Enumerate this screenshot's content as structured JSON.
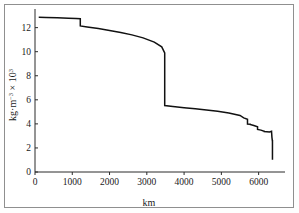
{
  "chart_data": {
    "type": "line",
    "title": "",
    "subtitle": "",
    "xlabel": "km",
    "ylabel": "kg·m⁻³ × 10³",
    "ylabel_parts": {
      "base": "kg·m",
      "exp1": "−3",
      "mid": " × 10",
      "exp2": "3"
    },
    "xlim": [
      0,
      6600
    ],
    "ylim": [
      0,
      13.3
    ],
    "xticks": [
      0,
      1000,
      2000,
      3000,
      4000,
      5000,
      6000
    ],
    "xticklabels": [
      "0",
      "1000",
      "2000",
      "3000",
      "4000",
      "5000",
      "6000"
    ],
    "yticks": [
      0,
      2,
      4,
      6,
      8,
      10,
      12
    ],
    "yticklabels": [
      "0",
      "2",
      "4",
      "6",
      "8",
      "10",
      "12"
    ],
    "grid": false,
    "legend": null,
    "series": [
      {
        "name": "density",
        "x": [
          100,
          300,
          600,
          900,
          1100,
          1215,
          1215,
          1400,
          1700,
          2000,
          2300,
          2600,
          2900,
          3200,
          3400,
          3480,
          3480,
          3700,
          4000,
          4300,
          4600,
          4900,
          5200,
          5500,
          5600,
          5701,
          5701,
          5771,
          5771,
          5871,
          5971,
          5971,
          6061,
          6151,
          6151,
          6221,
          6291,
          6346,
          6346,
          6356,
          6368,
          6371,
          6371
        ],
        "y": [
          12.86,
          12.85,
          12.83,
          12.79,
          12.76,
          12.74,
          12.14,
          12.06,
          11.92,
          11.76,
          11.6,
          11.4,
          11.15,
          10.8,
          10.4,
          9.9,
          5.52,
          5.45,
          5.35,
          5.25,
          5.15,
          5.05,
          4.9,
          4.7,
          4.5,
          4.38,
          3.99,
          3.97,
          3.96,
          3.87,
          3.76,
          3.54,
          3.48,
          3.38,
          3.36,
          3.35,
          3.33,
          3.38,
          3.38,
          2.9,
          2.6,
          2.6,
          1.02
        ]
      }
    ],
    "annotations": []
  },
  "axes": {
    "x_title": "km",
    "y_title": "kg·m⁻³ × 10³"
  },
  "colors": {
    "curve": "#111111",
    "axis": "#2b2b2b",
    "frame": "#8f8f8f",
    "background": "#ffffff"
  }
}
